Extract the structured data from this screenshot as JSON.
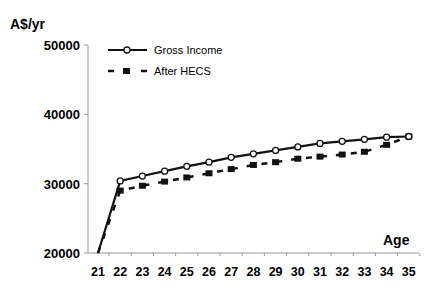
{
  "chart_data": {
    "type": "line",
    "title": "",
    "ylabel": "A$/yr",
    "xlabel": "Age",
    "x": [
      21,
      22,
      23,
      24,
      25,
      26,
      27,
      28,
      29,
      30,
      31,
      32,
      33,
      34,
      35
    ],
    "ylim": [
      20000,
      50000
    ],
    "yticks": [
      20000,
      30000,
      40000,
      50000
    ],
    "ytick_labels": [
      "20000",
      "30000",
      "40000",
      "50000"
    ],
    "xtick_labels": [
      "21",
      "22",
      "23",
      "24",
      "25",
      "26",
      "27",
      "28",
      "29",
      "30",
      "31",
      "32",
      "33",
      "34",
      "35"
    ],
    "grid": false,
    "legend_position": "upper-left",
    "series": [
      {
        "name": "Gross Income",
        "style": "solid line, open circle markers",
        "values": [
          20000,
          30400,
          31100,
          31800,
          32500,
          33100,
          33800,
          34300,
          34800,
          35300,
          35800,
          36100,
          36400,
          36700,
          36800
        ]
      },
      {
        "name": "After HECS",
        "style": "dashed line, filled square markers",
        "values": [
          20000,
          29000,
          29700,
          30300,
          30900,
          31500,
          32100,
          32700,
          33100,
          33600,
          33900,
          34200,
          34600,
          35600,
          36800
        ]
      }
    ]
  },
  "labels": {
    "ylabel": "A$/yr",
    "xlabel": "Age",
    "legend_gross": "Gross Income",
    "legend_hecs": "After HECS"
  }
}
